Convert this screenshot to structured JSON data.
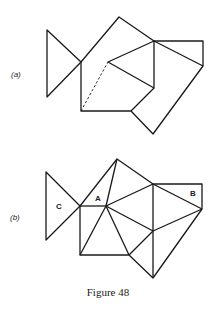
{
  "figure": {
    "caption": "Figure 48",
    "panels": [
      {
        "label": "(a)",
        "vertex_labels": []
      },
      {
        "label": "(b)",
        "vertex_labels": [
          "C",
          "A",
          "B"
        ]
      }
    ]
  }
}
